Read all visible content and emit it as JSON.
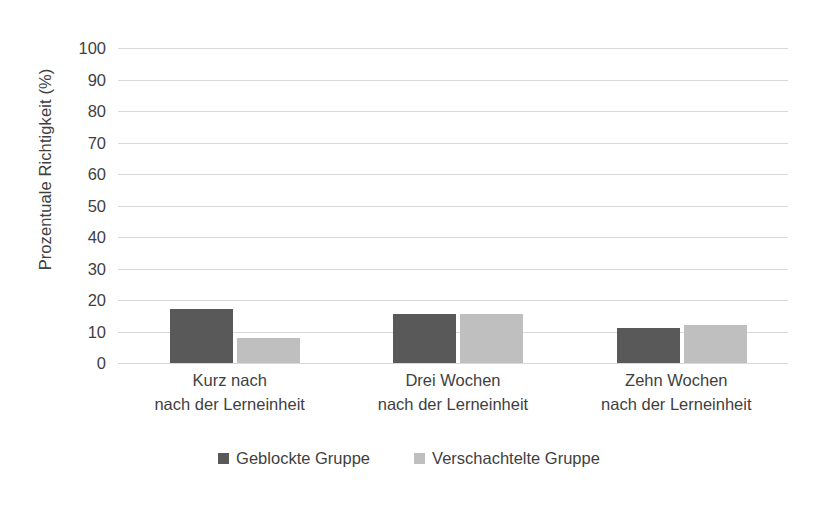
{
  "chart_data": {
    "type": "bar",
    "title": "",
    "subtitle": "",
    "xlabel": "",
    "ylabel": "Prozentuale Richtigkeit (%)",
    "categories": [
      "Kurz nach\nnach der Lerneinheit",
      "Drei Wochen\nnach der Lerneinheit",
      "Zehn Wochen\nnach der Lerneinheit"
    ],
    "category_lines": [
      [
        "Kurz nach",
        "nach der Lerneinheit"
      ],
      [
        "Drei Wochen",
        "nach der Lerneinheit"
      ],
      [
        "Zehn Wochen",
        "nach der Lerneinheit"
      ]
    ],
    "series": [
      {
        "name": "Geblockte Gruppe",
        "color": "#595959",
        "values": [
          17,
          15.5,
          11
        ]
      },
      {
        "name": "Verschachtelte Gruppe",
        "color": "#bfbfbf",
        "values": [
          8,
          15.5,
          12
        ]
      }
    ],
    "ylim": [
      0,
      100
    ],
    "yticks": [
      0,
      10,
      20,
      30,
      40,
      50,
      60,
      70,
      80,
      90,
      100
    ],
    "ytick_labels": [
      "0",
      "10",
      "20",
      "30",
      "40",
      "50",
      "60",
      "70",
      "80",
      "90",
      "100"
    ],
    "grid": true,
    "grid_color": "#d9d9d9",
    "legend_position": "bottom",
    "background": "#ffffff"
  },
  "legend": {
    "items": [
      {
        "label": "Geblockte Gruppe",
        "color": "#595959"
      },
      {
        "label": "Verschachtelte Gruppe",
        "color": "#bfbfbf"
      }
    ]
  }
}
